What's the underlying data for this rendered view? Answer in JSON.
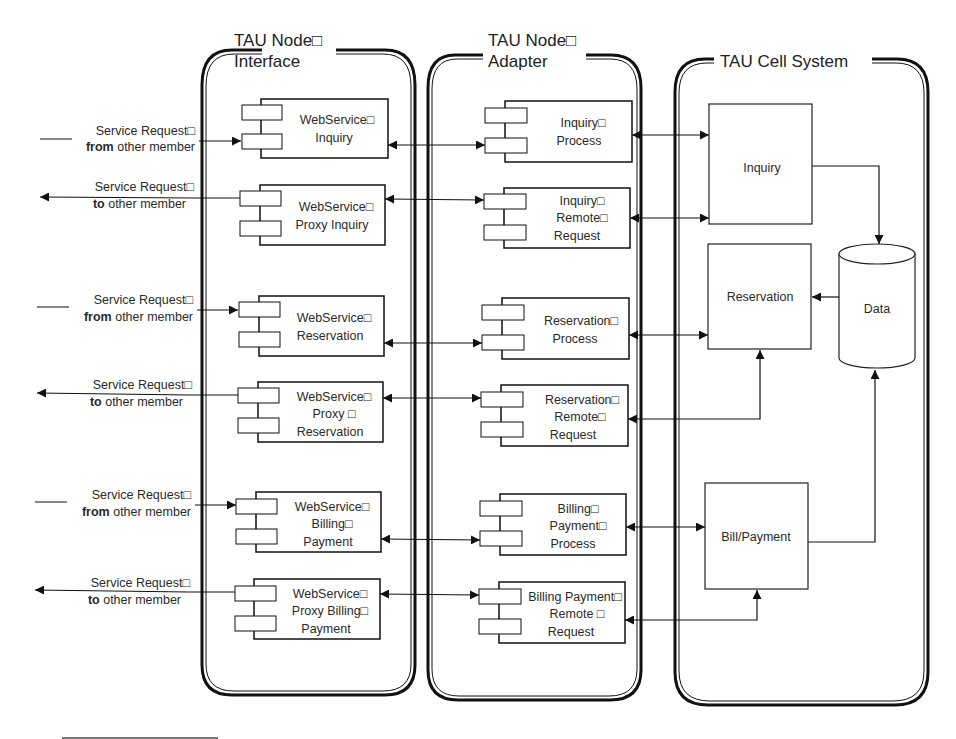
{
  "containers": {
    "interface": {
      "title_line1": "TAU Node□",
      "title_line2": "Interface"
    },
    "adapter": {
      "title_line1": "TAU Node□",
      "title_line2": "Adapter"
    },
    "cell": {
      "title": "TAU Cell System"
    }
  },
  "external": [
    {
      "line1": "Service Request□",
      "bold": "from",
      "rest": " other member",
      "direction": "in"
    },
    {
      "line1": "Service Request□",
      "bold": "to",
      "rest": " other member",
      "direction": "out"
    },
    {
      "line1": "Service Request□",
      "bold": "from",
      "rest": " other member",
      "direction": "in"
    },
    {
      "line1": "Service Request□",
      "bold": "to",
      "rest": " other member",
      "direction": "out"
    },
    {
      "line1": "Service Request□",
      "bold": "from",
      "rest": " other member",
      "direction": "in"
    },
    {
      "line1": "Service Request□",
      "bold": "to",
      "rest": " other member",
      "direction": "out"
    }
  ],
  "interface_components": [
    {
      "lines": [
        "WebService□",
        "Inquiry"
      ]
    },
    {
      "lines": [
        "WebService□",
        "Proxy Inquiry"
      ]
    },
    {
      "lines": [
        "WebService□",
        "Reservation"
      ]
    },
    {
      "lines": [
        "WebService□",
        "Proxy □",
        "Reservation"
      ]
    },
    {
      "lines": [
        "WebService□",
        "Billing□",
        "Payment"
      ]
    },
    {
      "lines": [
        "WebService□",
        "Proxy Billing□",
        "Payment"
      ]
    }
  ],
  "adapter_components": [
    {
      "lines": [
        "Inquiry□",
        "Process"
      ]
    },
    {
      "lines": [
        "Inquiry□",
        "Remote□",
        "Request"
      ]
    },
    {
      "lines": [
        "Reservation□",
        "Process"
      ]
    },
    {
      "lines": [
        "Reservation□",
        "Remote□",
        "Request"
      ]
    },
    {
      "lines": [
        "Billing□",
        "Payment□",
        "Process"
      ]
    },
    {
      "lines": [
        "Billing Payment□",
        "Remote □",
        "Request"
      ]
    }
  ],
  "cell_modules": [
    {
      "label": "Inquiry"
    },
    {
      "label": "Reservation"
    },
    {
      "label": "Bill/Payment"
    }
  ],
  "datastore": {
    "label": "Data"
  },
  "colors": {
    "line": "#1a1a1a",
    "background": "#ffffff",
    "text": "#2a2a2a"
  }
}
